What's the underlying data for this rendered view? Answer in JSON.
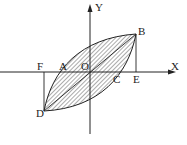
{
  "diagram": {
    "axes": {
      "x_label": "X",
      "y_label": "Y"
    },
    "points": {
      "origin": "O",
      "A": "A",
      "B": "B",
      "C": "C",
      "D": "D",
      "E": "E",
      "F": "F"
    },
    "colors": {
      "line": "#222222",
      "hatch": "#444444",
      "background": "#ffffff"
    }
  }
}
